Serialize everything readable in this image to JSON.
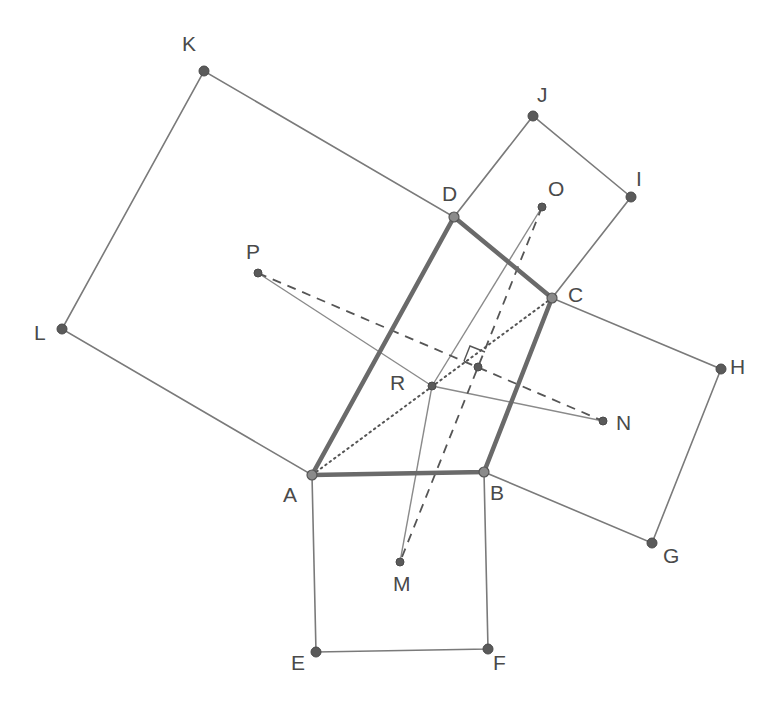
{
  "figure": {
    "points": {
      "A": {
        "label": "A",
        "x": 312,
        "y": 475
      },
      "B": {
        "label": "B",
        "x": 484,
        "y": 472
      },
      "C": {
        "label": "C",
        "x": 552,
        "y": 298
      },
      "D": {
        "label": "D",
        "x": 454,
        "y": 217
      },
      "E": {
        "label": "E",
        "x": 316,
        "y": 652
      },
      "F": {
        "label": "F",
        "x": 488,
        "y": 649
      },
      "G": {
        "label": "G",
        "x": 652,
        "y": 543
      },
      "H": {
        "label": "H",
        "x": 721,
        "y": 369
      },
      "I": {
        "label": "I",
        "x": 631,
        "y": 197
      },
      "J": {
        "label": "J",
        "x": 533,
        "y": 116
      },
      "K": {
        "label": "K",
        "x": 204,
        "y": 71
      },
      "L": {
        "label": "L",
        "x": 62,
        "y": 329
      },
      "M": {
        "label": "M",
        "x": 400,
        "y": 562
      },
      "N": {
        "label": "N",
        "x": 603,
        "y": 421
      },
      "O": {
        "label": "O",
        "x": 542,
        "y": 207
      },
      "P": {
        "label": "P",
        "x": 258,
        "y": 273
      },
      "R": {
        "label": "R",
        "x": 432,
        "y": 386
      },
      "X": {
        "label": "",
        "x": 478,
        "y": 367
      }
    },
    "quadrilateral": [
      "A",
      "B",
      "C",
      "D"
    ],
    "squares": [
      [
        "A",
        "B",
        "F",
        "E"
      ],
      [
        "B",
        "C",
        "H",
        "G"
      ],
      [
        "C",
        "D",
        "J",
        "I"
      ],
      [
        "D",
        "A",
        "L",
        "K"
      ]
    ],
    "solid_segments": [
      [
        "R",
        "P"
      ],
      [
        "R",
        "N"
      ],
      [
        "R",
        "M"
      ],
      [
        "R",
        "O"
      ]
    ],
    "dashed_segments": [
      [
        "P",
        "N"
      ],
      [
        "O",
        "M"
      ]
    ],
    "dotted_segments": [
      [
        "A",
        "C"
      ]
    ],
    "right_angle_marker": {
      "at": "X",
      "between": [
        "PN",
        "OM"
      ]
    }
  }
}
